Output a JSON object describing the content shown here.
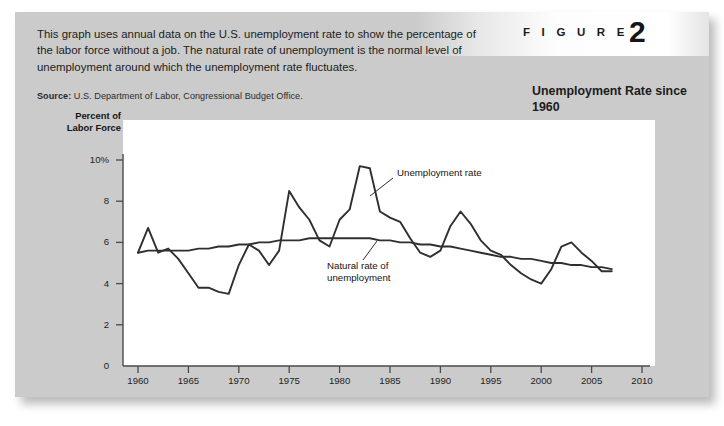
{
  "figure": {
    "label": "F I G U R E",
    "number": "2",
    "subtitle": "Unemployment Rate\nsince 1960",
    "caption": "This graph uses annual data on the U.S. unemployment rate to show the percentage of the labor force without a job. The natural rate of unemployment is the normal level of unemployment around which the unemployment rate fluctuates.",
    "source_label": "Source:",
    "source_text": "U.S. Department of Labor, Congressional Budget Office.",
    "panel_color": "#cbcbcb",
    "plot_background": "#ffffff",
    "line_color": "#2f2f2f"
  },
  "chart_data": {
    "type": "line",
    "title": "Unemployment Rate since 1960",
    "xlabel": "",
    "ylabel": "Percent of Labor Force",
    "xlim": [
      1960,
      2010
    ],
    "ylim": [
      0,
      10
    ],
    "xticks": [
      "1960",
      "1965",
      "1970",
      "1975",
      "1980",
      "1985",
      "1990",
      "1995",
      "2000",
      "2005",
      "2010"
    ],
    "yticks": [
      "0",
      "2",
      "4",
      "6",
      "8",
      "10%"
    ],
    "grid": false,
    "legend_position": "inline-annotation",
    "x": [
      1960,
      1961,
      1962,
      1963,
      1964,
      1965,
      1966,
      1967,
      1968,
      1969,
      1970,
      1971,
      1972,
      1973,
      1974,
      1975,
      1976,
      1977,
      1978,
      1979,
      1980,
      1981,
      1982,
      1983,
      1984,
      1985,
      1986,
      1987,
      1988,
      1989,
      1990,
      1991,
      1992,
      1993,
      1994,
      1995,
      1996,
      1997,
      1998,
      1999,
      2000,
      2001,
      2002,
      2003,
      2004,
      2005,
      2006,
      2007
    ],
    "series": [
      {
        "name": "Unemployment rate",
        "values": [
          5.5,
          6.7,
          5.5,
          5.7,
          5.2,
          4.5,
          3.8,
          3.8,
          3.6,
          3.5,
          4.9,
          5.9,
          5.6,
          4.9,
          5.6,
          8.5,
          7.7,
          7.1,
          6.1,
          5.8,
          7.1,
          7.6,
          9.7,
          9.6,
          7.5,
          7.2,
          7.0,
          6.2,
          5.5,
          5.3,
          5.6,
          6.8,
          7.5,
          6.9,
          6.1,
          5.6,
          5.4,
          4.9,
          4.5,
          4.2,
          4.0,
          4.7,
          5.8,
          6.0,
          5.5,
          5.1,
          4.6,
          4.6
        ]
      },
      {
        "name": "Natural rate of unemployment",
        "values": [
          5.5,
          5.6,
          5.6,
          5.6,
          5.6,
          5.6,
          5.7,
          5.7,
          5.8,
          5.8,
          5.9,
          5.9,
          6.0,
          6.0,
          6.1,
          6.1,
          6.1,
          6.2,
          6.2,
          6.2,
          6.2,
          6.2,
          6.2,
          6.2,
          6.1,
          6.1,
          6.0,
          6.0,
          5.9,
          5.9,
          5.8,
          5.8,
          5.7,
          5.6,
          5.5,
          5.4,
          5.3,
          5.3,
          5.2,
          5.2,
          5.1,
          5.0,
          5.0,
          4.9,
          4.9,
          4.8,
          4.8,
          4.7
        ]
      }
    ],
    "annotations": [
      {
        "text": "Unemployment rate",
        "at_year": 1984,
        "at_value": 9.2
      },
      {
        "text": "Natural rate of\nunemployment",
        "at_year": 1978,
        "at_value": 5.3
      }
    ]
  }
}
